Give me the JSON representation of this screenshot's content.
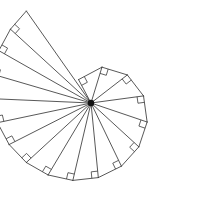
{
  "figure": {
    "type": "geometric-diagram",
    "background_color": "#ffffff",
    "line_color": "#3a3a3a",
    "center_dot_color": "#111111",
    "line_width": 0.85
  },
  "geometry": {
    "center_x": 91,
    "center_y": 103,
    "unit_length": 26.5,
    "start_angle_deg": -118,
    "direction": "counterclockwise-from-upper-left-sweeping-clockwise",
    "triangle_count": 17,
    "spoke_count": 18,
    "right_angle_marker_size": 6.5,
    "center_dot_radius": 3.2,
    "canvas_width": 223,
    "canvas_height": 203
  },
  "chart_data": {
    "type": "line",
    "xlabel": "",
    "ylabel": "",
    "n_values": [
      1,
      2,
      3,
      4,
      5,
      6,
      7,
      8,
      9,
      10,
      11,
      12,
      13,
      14,
      15,
      16,
      17,
      18
    ],
    "radii_sqrt_n": [
      1.0,
      1.414,
      1.732,
      2.0,
      2.236,
      2.449,
      2.646,
      2.828,
      3.0,
      3.162,
      3.317,
      3.464,
      3.606,
      3.742,
      3.873,
      4.0,
      4.123,
      4.243
    ],
    "radii_pixels": [
      26.5,
      37.5,
      45.9,
      53.0,
      59.3,
      64.9,
      70.1,
      75.0,
      79.5,
      83.8,
      87.9,
      91.8,
      95.6,
      99.2,
      102.6,
      106.0,
      109.3,
      112.4
    ],
    "cumulative_angles_deg": [
      0,
      45.0,
      80.3,
      110.3,
      136.7,
      160.5,
      182.3,
      202.4,
      221.2,
      238.8,
      255.4,
      271.1,
      286.1,
      300.5,
      314.3,
      327.6,
      340.5,
      352.9
    ],
    "angles_absolute_deg": [
      -118.0,
      -73.0,
      -37.7,
      -7.7,
      18.7,
      42.5,
      64.3,
      84.4,
      103.2,
      120.8,
      137.4,
      153.1,
      168.1,
      182.5,
      196.3,
      209.6,
      222.5,
      234.9
    ],
    "grid": false,
    "legend": null
  }
}
